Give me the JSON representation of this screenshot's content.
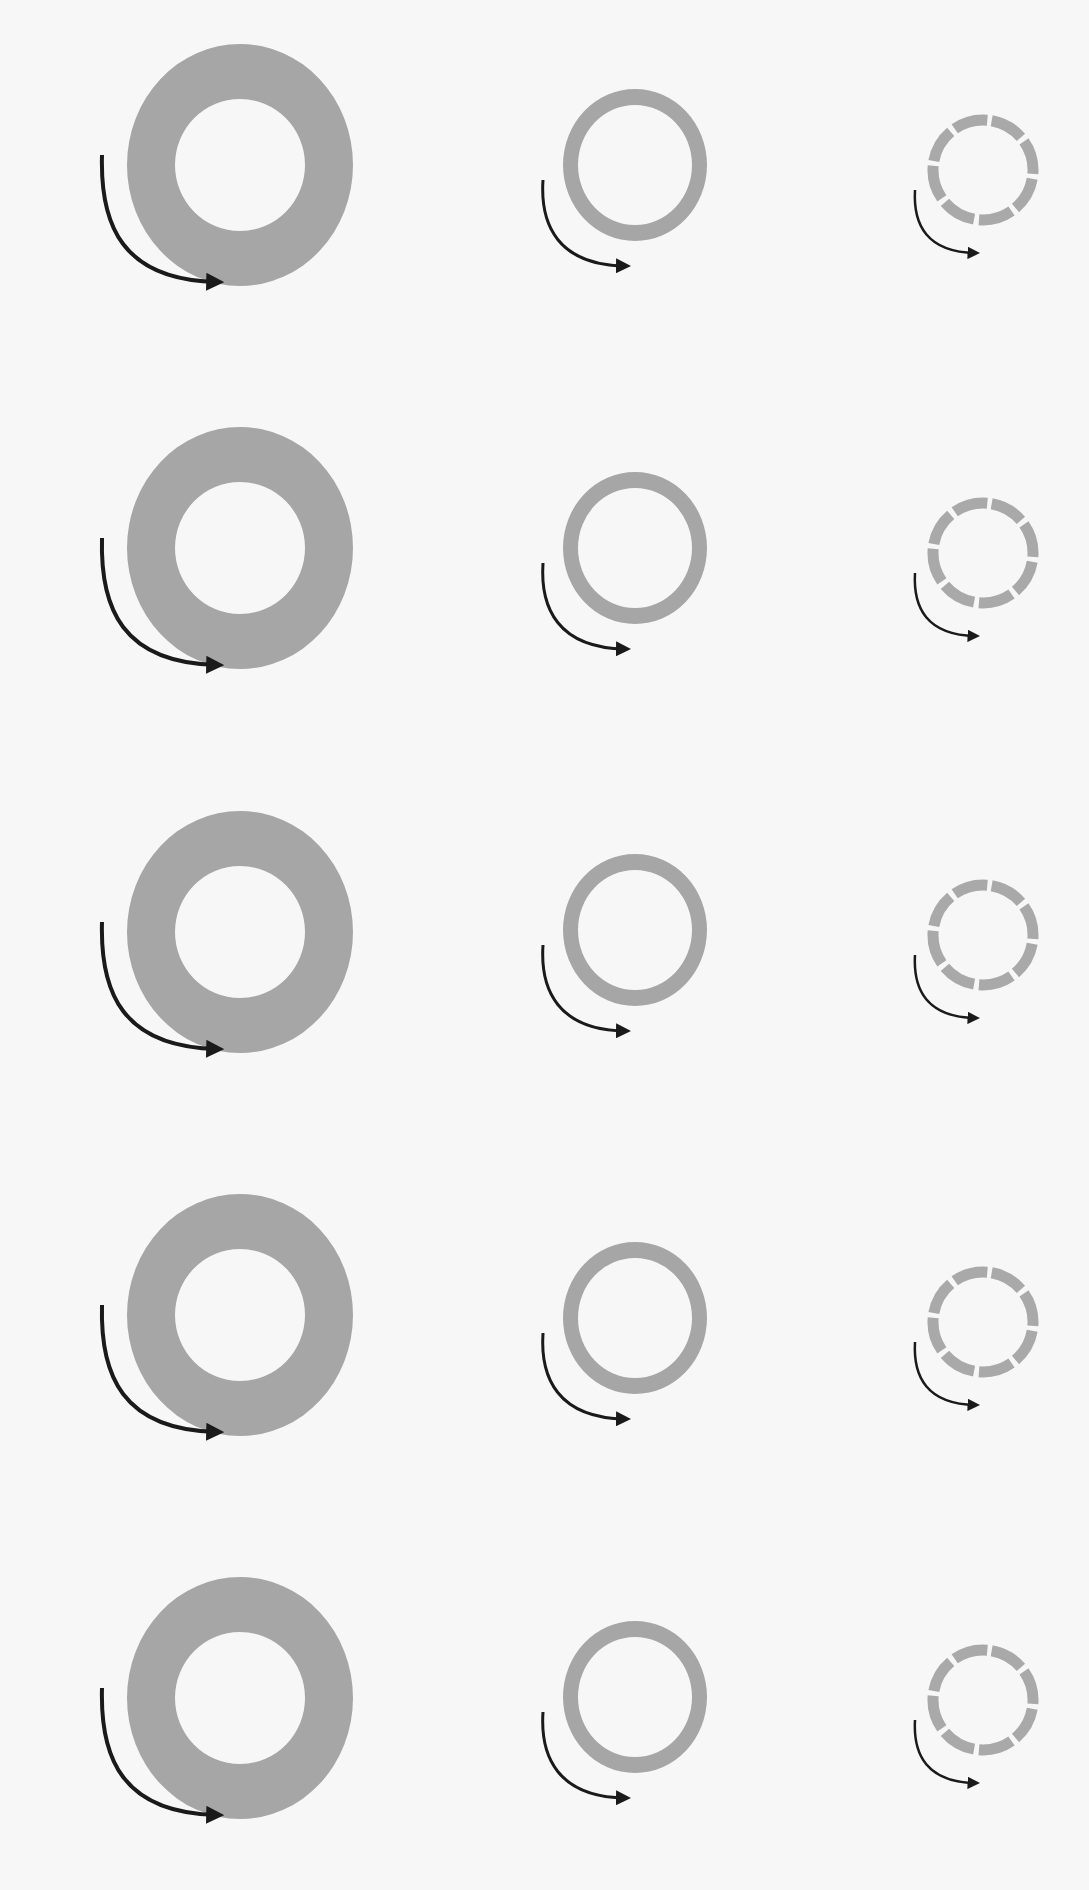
{
  "diagram": {
    "background": "#f7f7f7",
    "ring_color": "#a6a6a6",
    "dashed_ring_color": "#a9a9a9",
    "arrow_color": "#1a1a1a",
    "columns": [
      {
        "id": "thick-solid",
        "cx": 240,
        "rx_outer": 113,
        "ry_outer": 121,
        "rx_inner": 65,
        "ry_inner": 66,
        "style": "solid"
      },
      {
        "id": "thin-solid",
        "cx": 635,
        "rx_outer": 72,
        "ry_outer": 76,
        "rx_inner": 57,
        "ry_inner": 60,
        "style": "solid"
      },
      {
        "id": "dashed",
        "cx": 983,
        "r": 50,
        "stroke": 11,
        "segments": 8,
        "style": "dashed"
      }
    ],
    "rows": [
      {
        "cy_large": 165,
        "cy_mid": 165,
        "cy_small": 170
      },
      {
        "cy_large": 548,
        "cy_mid": 548,
        "cy_small": 553
      },
      {
        "cy_large": 932,
        "cy_mid": 930,
        "cy_small": 935
      },
      {
        "cy_large": 1315,
        "cy_mid": 1318,
        "cy_small": 1322
      },
      {
        "cy_large": 1698,
        "cy_mid": 1697,
        "cy_small": 1700
      }
    ]
  }
}
